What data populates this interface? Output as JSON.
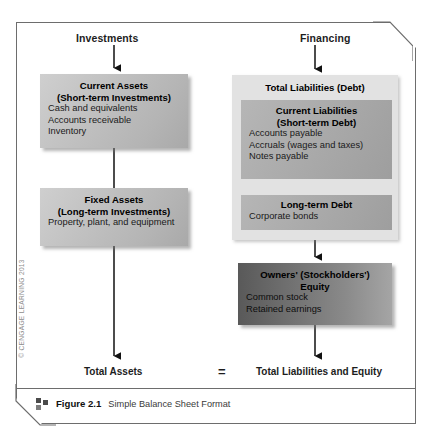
{
  "figure": {
    "caption_number": "Figure 2.1",
    "caption_title": "Simple Balance Sheet Format",
    "caption_icon": "four-squares-icon",
    "copyright": "© CENGAGE LEARNING 2013"
  },
  "columns": {
    "left_heading": "Investments",
    "right_heading": "Financing"
  },
  "boxes": {
    "current_assets": {
      "title_line1": "Current Assets",
      "title_line2": "(Short-term Investments)",
      "items": [
        "Cash and equivalents",
        "Accounts receivable",
        "Inventory"
      ],
      "fill": "#c2c2c2"
    },
    "fixed_assets": {
      "title_line1": "Fixed Assets",
      "title_line2": "(Long-term Investments)",
      "items": [
        "Property, plant, and equipment"
      ],
      "fill": "#c2c2c2"
    },
    "total_liabilities": {
      "title": "Total Liabilities (Debt)",
      "fill": "#e2e2e2"
    },
    "current_liabilities": {
      "title_line1": "Current Liabilities",
      "title_line2": "(Short-term Debt)",
      "items": [
        "Accounts payable",
        "Accruals (wages and taxes)",
        "Notes payable"
      ],
      "fill": "#ababab"
    },
    "longterm_debt": {
      "title_line1": "Long-term Debt",
      "items": [
        "Corporate bonds"
      ],
      "fill": "#ababab"
    },
    "owners_equity": {
      "title_line1": "Owners' (Stockholders')",
      "title_line2": "Equity",
      "items": [
        "Common stock",
        "Retained earnings"
      ],
      "fill": "#6e6e6e"
    }
  },
  "totals": {
    "left": "Total Assets",
    "equals": "=",
    "right": "Total Liabilities and Equity"
  }
}
